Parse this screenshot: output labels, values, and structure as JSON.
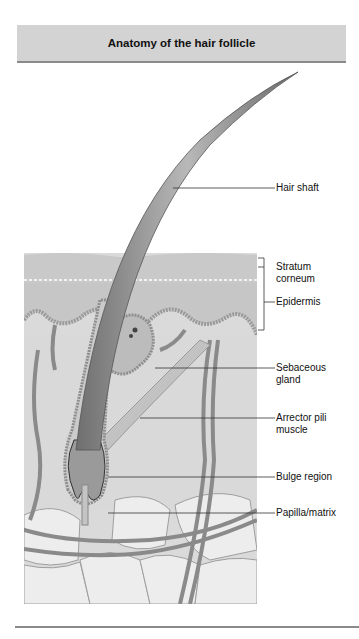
{
  "header": {
    "title": "Anatomy of the hair follicle"
  },
  "labels": {
    "hair_shaft": "Hair shaft",
    "stratum_corneum_1": "Stratum",
    "stratum_corneum_2": "corneum",
    "epidermis": "Epidermis",
    "sebaceous_1": "Sebaceous",
    "sebaceous_2": "gland",
    "arrector_1": "Arrector pili",
    "arrector_2": "muscle",
    "bulge": "Bulge region",
    "papilla": "Papilla/matrix"
  },
  "colors": {
    "header_bg": "#d3d3d3",
    "header_rule": "#8a8a8a",
    "skin_top": "#cfcfcf",
    "dermis": "#dcdcdc",
    "fat": "#ececec",
    "hair": "#8c8c8c"
  }
}
